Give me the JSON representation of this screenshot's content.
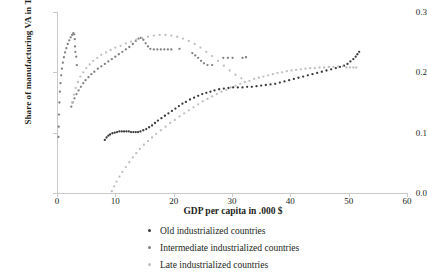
{
  "chart_data": {
    "type": "scatter",
    "title": "",
    "xlabel": "GDP per capita in .000 $",
    "ylabel": "Share of manufacturing VA in Tot VA",
    "xlim": [
      0,
      60
    ],
    "ylim": [
      0.0,
      0.3
    ],
    "xticks": [
      "0",
      "10",
      "20",
      "30",
      "40",
      "50",
      "60"
    ],
    "yticks": [
      "0.0",
      "0.1",
      "0.2",
      "0.3"
    ],
    "xtick_values": [
      0,
      10,
      20,
      30,
      40,
      50,
      60
    ],
    "ytick_values": [
      0.0,
      0.1,
      0.2,
      0.3
    ],
    "grid": false,
    "legend_position": "below",
    "series": [
      {
        "name": "Old industrialized countries",
        "color": "#3a3a3c",
        "points": [
          [
            8.2,
            0.088
          ],
          [
            8.5,
            0.092
          ],
          [
            8.8,
            0.095
          ],
          [
            9.1,
            0.097
          ],
          [
            9.5,
            0.099
          ],
          [
            9.9,
            0.1
          ],
          [
            10.3,
            0.101
          ],
          [
            10.7,
            0.102
          ],
          [
            11.1,
            0.102
          ],
          [
            11.5,
            0.102
          ],
          [
            11.9,
            0.102
          ],
          [
            12.3,
            0.102
          ],
          [
            12.7,
            0.101
          ],
          [
            13.1,
            0.101
          ],
          [
            13.5,
            0.101
          ],
          [
            13.9,
            0.101
          ],
          [
            14.3,
            0.102
          ],
          [
            14.8,
            0.104
          ],
          [
            15.3,
            0.106
          ],
          [
            15.8,
            0.109
          ],
          [
            16.3,
            0.112
          ],
          [
            16.8,
            0.116
          ],
          [
            17.3,
            0.12
          ],
          [
            17.9,
            0.124
          ],
          [
            18.5,
            0.128
          ],
          [
            19.1,
            0.132
          ],
          [
            19.7,
            0.136
          ],
          [
            20.3,
            0.14
          ],
          [
            20.9,
            0.144
          ],
          [
            21.5,
            0.148
          ],
          [
            22.1,
            0.151
          ],
          [
            22.8,
            0.155
          ],
          [
            23.5,
            0.158
          ],
          [
            24.2,
            0.161
          ],
          [
            24.9,
            0.164
          ],
          [
            25.6,
            0.166
          ],
          [
            26.3,
            0.168
          ],
          [
            27.0,
            0.17
          ],
          [
            27.8,
            0.172
          ],
          [
            28.6,
            0.173
          ],
          [
            29.4,
            0.174
          ],
          [
            30.2,
            0.175
          ],
          [
            31.0,
            0.175
          ],
          [
            31.8,
            0.175
          ],
          [
            32.6,
            0.176
          ],
          [
            33.4,
            0.176
          ],
          [
            34.2,
            0.177
          ],
          [
            35.0,
            0.178
          ],
          [
            35.8,
            0.179
          ],
          [
            36.6,
            0.18
          ],
          [
            37.4,
            0.181
          ],
          [
            38.2,
            0.183
          ],
          [
            39.0,
            0.185
          ],
          [
            39.8,
            0.187
          ],
          [
            40.6,
            0.189
          ],
          [
            41.4,
            0.191
          ],
          [
            42.2,
            0.193
          ],
          [
            43.0,
            0.195
          ],
          [
            43.8,
            0.197
          ],
          [
            44.6,
            0.199
          ],
          [
            45.4,
            0.201
          ],
          [
            46.2,
            0.203
          ],
          [
            47.0,
            0.205
          ],
          [
            47.8,
            0.207
          ],
          [
            48.5,
            0.209
          ],
          [
            49.2,
            0.211
          ],
          [
            49.8,
            0.214
          ],
          [
            50.3,
            0.218
          ],
          [
            50.8,
            0.222
          ],
          [
            51.2,
            0.226
          ],
          [
            51.5,
            0.23
          ],
          [
            51.8,
            0.234
          ]
        ]
      },
      {
        "name": "Intermediate industrialized countries",
        "color": "#7f7f84",
        "points": [
          [
            0.25,
            0.093
          ],
          [
            0.3,
            0.11
          ],
          [
            0.35,
            0.13
          ],
          [
            0.42,
            0.15
          ],
          [
            0.5,
            0.168
          ],
          [
            0.6,
            0.182
          ],
          [
            0.72,
            0.195
          ],
          [
            0.85,
            0.206
          ],
          [
            1.0,
            0.216
          ],
          [
            1.18,
            0.225
          ],
          [
            1.38,
            0.233
          ],
          [
            1.6,
            0.24
          ],
          [
            1.85,
            0.247
          ],
          [
            2.1,
            0.253
          ],
          [
            2.35,
            0.258
          ],
          [
            2.6,
            0.262
          ],
          [
            2.8,
            0.265
          ],
          [
            2.95,
            0.263
          ],
          [
            3.05,
            0.255
          ],
          [
            3.1,
            0.243
          ],
          [
            3.15,
            0.234
          ],
          [
            3.3,
            0.226
          ],
          [
            3.4,
            0.212
          ],
          [
            2.45,
            0.143
          ],
          [
            2.7,
            0.15
          ],
          [
            3.0,
            0.157
          ],
          [
            3.35,
            0.164
          ],
          [
            3.7,
            0.17
          ],
          [
            4.1,
            0.176
          ],
          [
            4.5,
            0.182
          ],
          [
            4.9,
            0.187
          ],
          [
            5.4,
            0.192
          ],
          [
            5.9,
            0.197
          ],
          [
            6.4,
            0.201
          ],
          [
            7.0,
            0.206
          ],
          [
            7.6,
            0.21
          ],
          [
            8.2,
            0.214
          ],
          [
            8.8,
            0.218
          ],
          [
            9.4,
            0.222
          ],
          [
            10.0,
            0.226
          ],
          [
            10.6,
            0.23
          ],
          [
            11.2,
            0.234
          ],
          [
            11.8,
            0.238
          ],
          [
            12.4,
            0.242
          ],
          [
            13.0,
            0.247
          ],
          [
            13.5,
            0.252
          ],
          [
            14.0,
            0.256
          ],
          [
            14.4,
            0.257
          ],
          [
            14.8,
            0.254
          ],
          [
            15.2,
            0.248
          ],
          [
            15.6,
            0.243
          ],
          [
            16.0,
            0.239
          ],
          [
            16.6,
            0.238
          ],
          [
            17.2,
            0.238
          ],
          [
            17.8,
            0.238
          ],
          [
            18.4,
            0.238
          ],
          [
            19.0,
            0.238
          ],
          [
            19.6,
            0.238
          ],
          [
            21.0,
            0.239
          ],
          [
            23.2,
            0.232
          ],
          [
            23.7,
            0.228
          ],
          [
            24.2,
            0.224
          ],
          [
            24.7,
            0.219
          ],
          [
            25.2,
            0.215
          ],
          [
            25.8,
            0.212
          ],
          [
            26.6,
            0.212
          ],
          [
            28.5,
            0.224
          ],
          [
            29.3,
            0.224
          ],
          [
            30.1,
            0.224
          ],
          [
            31.8,
            0.224
          ],
          [
            32.4,
            0.225
          ]
        ]
      },
      {
        "name": "Late industrialized countries",
        "color": "#bfbfc2",
        "points": [
          [
            9.4,
            0.003
          ],
          [
            9.8,
            0.011
          ],
          [
            10.2,
            0.019
          ],
          [
            10.7,
            0.027
          ],
          [
            11.2,
            0.035
          ],
          [
            11.8,
            0.043
          ],
          [
            12.4,
            0.051
          ],
          [
            13.0,
            0.059
          ],
          [
            13.6,
            0.066
          ],
          [
            14.2,
            0.073
          ],
          [
            14.9,
            0.08
          ],
          [
            15.6,
            0.086
          ],
          [
            16.3,
            0.092
          ],
          [
            17.0,
            0.098
          ],
          [
            17.8,
            0.104
          ],
          [
            18.6,
            0.11
          ],
          [
            19.4,
            0.116
          ],
          [
            20.2,
            0.121
          ],
          [
            21.0,
            0.127
          ],
          [
            21.8,
            0.132
          ],
          [
            22.6,
            0.137
          ],
          [
            23.4,
            0.142
          ],
          [
            24.2,
            0.147
          ],
          [
            25.0,
            0.152
          ],
          [
            25.8,
            0.156
          ],
          [
            26.6,
            0.16
          ],
          [
            27.4,
            0.164
          ],
          [
            28.2,
            0.168
          ],
          [
            29.0,
            0.171
          ],
          [
            29.8,
            0.175
          ],
          [
            30.6,
            0.178
          ],
          [
            31.4,
            0.181
          ],
          [
            32.2,
            0.184
          ],
          [
            33.0,
            0.186
          ],
          [
            33.8,
            0.189
          ],
          [
            34.6,
            0.191
          ],
          [
            35.4,
            0.193
          ],
          [
            36.2,
            0.195
          ],
          [
            37.0,
            0.197
          ],
          [
            37.8,
            0.199
          ],
          [
            38.6,
            0.2
          ],
          [
            39.4,
            0.202
          ],
          [
            40.2,
            0.203
          ],
          [
            41.0,
            0.204
          ],
          [
            41.8,
            0.205
          ],
          [
            42.6,
            0.206
          ],
          [
            43.4,
            0.207
          ],
          [
            44.2,
            0.207
          ],
          [
            45.0,
            0.208
          ],
          [
            45.8,
            0.208
          ],
          [
            46.6,
            0.209
          ],
          [
            47.4,
            0.209
          ],
          [
            48.2,
            0.21
          ],
          [
            49.0,
            0.21
          ],
          [
            49.6,
            0.208
          ],
          [
            50.2,
            0.208
          ],
          [
            50.8,
            0.208
          ],
          [
            51.3,
            0.208
          ],
          [
            2.6,
            0.15
          ],
          [
            2.9,
            0.163
          ],
          [
            3.2,
            0.174
          ],
          [
            3.6,
            0.184
          ],
          [
            4.0,
            0.193
          ],
          [
            4.5,
            0.2
          ],
          [
            5.0,
            0.207
          ],
          [
            5.6,
            0.213
          ],
          [
            6.2,
            0.219
          ],
          [
            6.9,
            0.224
          ],
          [
            7.6,
            0.229
          ],
          [
            8.4,
            0.233
          ],
          [
            9.2,
            0.237
          ],
          [
            10.0,
            0.241
          ],
          [
            10.9,
            0.244
          ],
          [
            11.8,
            0.248
          ],
          [
            12.7,
            0.251
          ],
          [
            13.6,
            0.254
          ],
          [
            14.6,
            0.257
          ],
          [
            15.6,
            0.259
          ],
          [
            16.6,
            0.261
          ],
          [
            17.6,
            0.262
          ],
          [
            18.6,
            0.262
          ],
          [
            19.6,
            0.261
          ],
          [
            20.6,
            0.259
          ],
          [
            21.6,
            0.256
          ],
          [
            22.6,
            0.252
          ],
          [
            23.6,
            0.247
          ],
          [
            24.6,
            0.241
          ],
          [
            25.6,
            0.234
          ],
          [
            26.6,
            0.227
          ],
          [
            27.6,
            0.219
          ],
          [
            28.6,
            0.211
          ],
          [
            29.6,
            0.203
          ],
          [
            30.6,
            0.196
          ],
          [
            31.6,
            0.19
          ]
        ]
      }
    ]
  },
  "axes": {
    "ylabel": "Share of manufacturing VA in Tot VA",
    "xlabel": "GDP per capita in .000 $",
    "ytick_0": "0.0",
    "ytick_1": "0.1",
    "ytick_2": "0.2",
    "ytick_3": "0.3",
    "xtick_0": "0",
    "xtick_1": "10",
    "xtick_2": "20",
    "xtick_3": "30",
    "xtick_4": "40",
    "xtick_5": "50",
    "xtick_6": "60"
  },
  "legend": {
    "items": [
      {
        "label": "Old industrialized countries",
        "color": "#3a3a3c"
      },
      {
        "label": "Intermediate industrialized countries",
        "color": "#7f7f84"
      },
      {
        "label": "Late industrialized countries",
        "color": "#bfbfc2"
      }
    ]
  },
  "colors": {
    "axis": "#c9c9c9",
    "text": "#231f20",
    "background": "#ffffff"
  }
}
